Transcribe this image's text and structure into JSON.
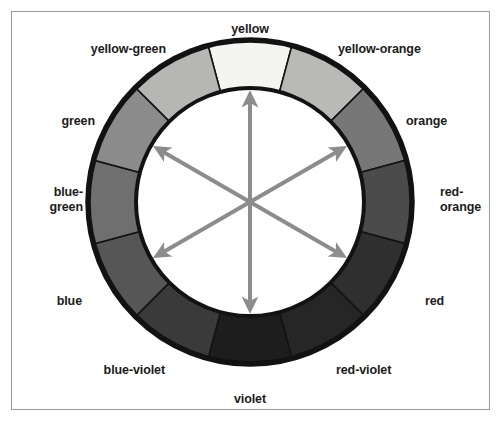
{
  "figure": {
    "background_color": "#ffffff",
    "frame_color": "#9a9a9a"
  },
  "wheel": {
    "center_x": 250,
    "center_y": 202,
    "outer_radius": 162,
    "inner_radius": 114,
    "ring_stroke_color": "#121212",
    "inner_fill": "#ffffff",
    "segment_count": 12
  },
  "segments": [
    {
      "name": "yellow",
      "label": "yellow",
      "angle_deg": 0,
      "fill": "#f4f4f1"
    },
    {
      "name": "yellow-orange",
      "label": "yellow-orange",
      "angle_deg": 30,
      "fill": "#b9b9b7"
    },
    {
      "name": "orange",
      "label": "orange",
      "angle_deg": 60,
      "fill": "#777777"
    },
    {
      "name": "red-orange",
      "label": "red-orange",
      "angle_deg": 90,
      "fill": "#4b4b4b"
    },
    {
      "name": "red",
      "label": "red",
      "angle_deg": 120,
      "fill": "#2f2f2f"
    },
    {
      "name": "red-violet",
      "label": "red-violet",
      "angle_deg": 150,
      "fill": "#262626"
    },
    {
      "name": "violet",
      "label": "violet",
      "angle_deg": 180,
      "fill": "#1d1d1d"
    },
    {
      "name": "blue-violet",
      "label": "blue-violet",
      "angle_deg": 210,
      "fill": "#3a3a3a"
    },
    {
      "name": "blue",
      "label": "blue",
      "angle_deg": 240,
      "fill": "#565656"
    },
    {
      "name": "blue-green",
      "label": "blue-green",
      "angle_deg": 270,
      "fill": "#6f6f6f"
    },
    {
      "name": "green",
      "label": "green",
      "angle_deg": 300,
      "fill": "#8b8b8b"
    },
    {
      "name": "yellow-green",
      "label": "yellow-green",
      "angle_deg": 330,
      "fill": "#b6b6b4"
    }
  ],
  "labels": [
    {
      "name": "yellow",
      "text": "yellow",
      "x": 250,
      "y": 22,
      "align": "center"
    },
    {
      "name": "yellow-orange",
      "text": "yellow-orange",
      "x": 338,
      "y": 42,
      "align": "left"
    },
    {
      "name": "orange",
      "text": "orange",
      "x": 406,
      "y": 114,
      "align": "left"
    },
    {
      "name": "red-orange",
      "text": "red-\norange",
      "x": 440,
      "y": 185,
      "align": "left"
    },
    {
      "name": "red",
      "text": "red",
      "x": 425,
      "y": 294,
      "align": "left"
    },
    {
      "name": "red-violet",
      "text": "red-violet",
      "x": 336,
      "y": 363,
      "align": "left"
    },
    {
      "name": "violet",
      "text": "violet",
      "x": 250,
      "y": 392,
      "align": "center"
    },
    {
      "name": "blue-violet",
      "text": "blue-violet",
      "x": 165,
      "y": 363,
      "align": "right"
    },
    {
      "name": "blue",
      "text": "blue",
      "x": 82,
      "y": 294,
      "align": "right"
    },
    {
      "name": "blue-green",
      "text": "blue-\ngreen",
      "x": 83,
      "y": 185,
      "align": "right"
    },
    {
      "name": "green",
      "text": "green",
      "x": 95,
      "y": 114,
      "align": "right"
    },
    {
      "name": "yellow-green",
      "text": "yellow-green",
      "x": 166,
      "y": 42,
      "align": "right"
    }
  ],
  "arrows": {
    "color": "#8c8c8c",
    "stroke_width": 4,
    "length_radius": 104,
    "description": "three double-headed complementary-color arrows",
    "items": [
      {
        "name": "arrow-yellow-violet",
        "angle_deg": 0,
        "from": "yellow",
        "to": "violet"
      },
      {
        "name": "arrow-yelloworange-blueviolet",
        "angle_deg": 60,
        "from": "yellow-orange",
        "to": "blue-violet"
      },
      {
        "name": "arrow-yellowgreen-redviolet",
        "angle_deg": 300,
        "from": "yellow-green",
        "to": "red-violet"
      }
    ]
  }
}
